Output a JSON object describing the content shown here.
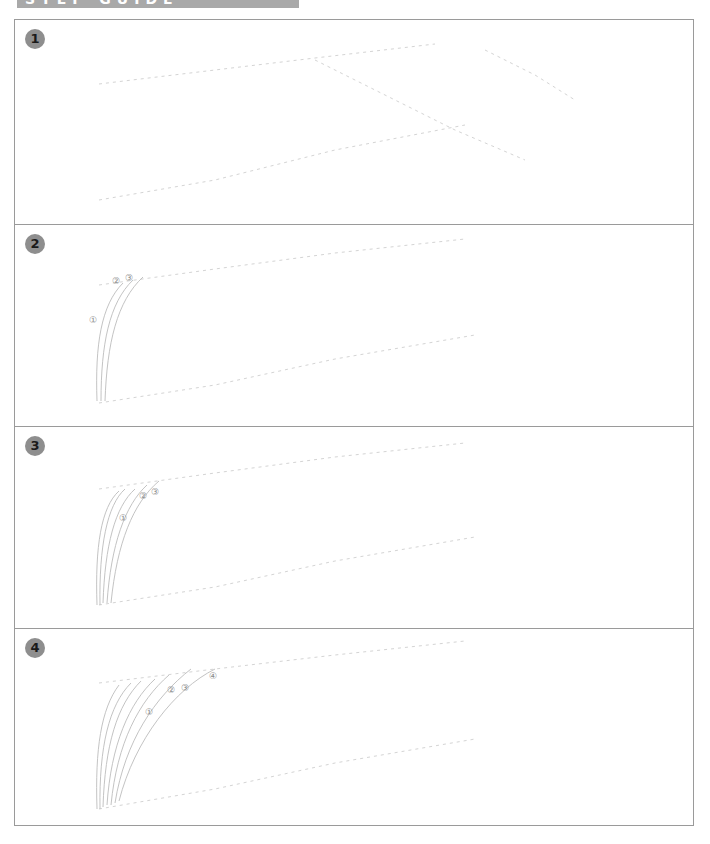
{
  "header": {
    "title": "STEP GUIDE"
  },
  "colors": {
    "border": "#9a9a9a",
    "badge": "#8e8e8e",
    "guide": "#d4d4d4",
    "curve": "#bcbcbc"
  },
  "panels": [
    {
      "step": "1",
      "labels": []
    },
    {
      "step": "2",
      "labels": [
        "①",
        "②",
        "③"
      ]
    },
    {
      "step": "3",
      "labels": [
        "①",
        "②",
        "③"
      ]
    },
    {
      "step": "4",
      "labels": [
        "①",
        "②",
        "③",
        "④"
      ]
    }
  ]
}
